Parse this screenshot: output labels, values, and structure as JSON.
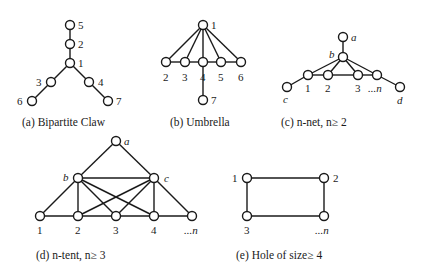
{
  "figures": [
    {
      "id": "a",
      "caption": "(a) Bipartite Claw",
      "caption_pos": [
        22,
        126
      ],
      "nodes": [
        {
          "label": "5",
          "x": 70,
          "y": 25,
          "lx": 78,
          "ly": 29,
          "italic": false
        },
        {
          "label": "2",
          "x": 70,
          "y": 44,
          "lx": 78,
          "ly": 48,
          "italic": false
        },
        {
          "label": "1",
          "x": 70,
          "y": 63,
          "lx": 78,
          "ly": 67,
          "italic": false
        },
        {
          "label": "3",
          "x": 51,
          "y": 82,
          "lx": 36,
          "ly": 86,
          "italic": false
        },
        {
          "label": "4",
          "x": 89,
          "y": 82,
          "lx": 98,
          "ly": 86,
          "italic": false
        },
        {
          "label": "6",
          "x": 32,
          "y": 101,
          "lx": 17,
          "ly": 105,
          "italic": false
        },
        {
          "label": "7",
          "x": 108,
          "y": 101,
          "lx": 116,
          "ly": 105,
          "italic": false
        }
      ],
      "edges": [
        [
          0,
          1
        ],
        [
          1,
          2
        ],
        [
          2,
          3
        ],
        [
          2,
          4
        ],
        [
          3,
          5
        ],
        [
          4,
          6
        ]
      ]
    },
    {
      "id": "b",
      "caption": "(b) Umbrella",
      "caption_pos": [
        170,
        126
      ],
      "nodes": [
        {
          "label": "1",
          "x": 203,
          "y": 25,
          "lx": 211,
          "ly": 29,
          "italic": false
        },
        {
          "label": "2",
          "x": 166,
          "y": 62,
          "lx": 163,
          "ly": 81,
          "italic": false
        },
        {
          "label": "3",
          "x": 185,
          "y": 62,
          "lx": 182,
          "ly": 81,
          "italic": false
        },
        {
          "label": "4",
          "x": 203,
          "y": 62,
          "lx": 200,
          "ly": 81,
          "italic": false
        },
        {
          "label": "5",
          "x": 221,
          "y": 62,
          "lx": 218,
          "ly": 81,
          "italic": false
        },
        {
          "label": "6",
          "x": 241,
          "y": 62,
          "lx": 238,
          "ly": 81,
          "italic": false
        },
        {
          "label": "7",
          "x": 203,
          "y": 100,
          "lx": 211,
          "ly": 104,
          "italic": false
        }
      ],
      "edges": [
        [
          0,
          1
        ],
        [
          0,
          2
        ],
        [
          0,
          3
        ],
        [
          0,
          4
        ],
        [
          0,
          5
        ],
        [
          1,
          2
        ],
        [
          2,
          3
        ],
        [
          3,
          4
        ],
        [
          4,
          5
        ],
        [
          3,
          6
        ]
      ]
    },
    {
      "id": "c",
      "caption": "(c) n-net, n≥ 2",
      "caption_pos": [
        281,
        126
      ],
      "nodes": [
        {
          "label": "a",
          "x": 343,
          "y": 37,
          "lx": 351,
          "ly": 41,
          "italic": true
        },
        {
          "label": "b",
          "x": 343,
          "y": 57,
          "lx": 329,
          "ly": 58,
          "italic": true
        },
        {
          "label": "1",
          "x": 308,
          "y": 75,
          "lx": 305,
          "ly": 92,
          "italic": false
        },
        {
          "label": "2",
          "x": 328,
          "y": 75,
          "lx": 325,
          "ly": 92,
          "italic": false
        },
        {
          "label": "3",
          "x": 358,
          "y": 75,
          "lx": 355,
          "ly": 92,
          "italic": false
        },
        {
          "label": "...n",
          "x": 377,
          "y": 75,
          "lx": 368,
          "ly": 92,
          "italic": true
        },
        {
          "label": "c",
          "x": 287,
          "y": 87,
          "lx": 283,
          "ly": 103,
          "italic": true
        },
        {
          "label": "d",
          "x": 400,
          "y": 87,
          "lx": 397,
          "ly": 104,
          "italic": true
        }
      ],
      "edges": [
        [
          0,
          1
        ],
        [
          1,
          2
        ],
        [
          1,
          3
        ],
        [
          1,
          4
        ],
        [
          1,
          5
        ],
        [
          2,
          3
        ],
        [
          3,
          4
        ],
        [
          4,
          5
        ],
        [
          6,
          2
        ],
        [
          5,
          7
        ]
      ]
    },
    {
      "id": "d",
      "caption": "(d) n-tent, n≥ 3",
      "caption_pos": [
        36,
        259
      ],
      "nodes": [
        {
          "label": "a",
          "x": 116,
          "y": 141,
          "lx": 124,
          "ly": 145,
          "italic": true
        },
        {
          "label": "b",
          "x": 78,
          "y": 178,
          "lx": 63,
          "ly": 181,
          "italic": true
        },
        {
          "label": "c",
          "x": 154,
          "y": 178,
          "lx": 164,
          "ly": 182,
          "italic": true
        },
        {
          "label": "1",
          "x": 40,
          "y": 216,
          "lx": 37,
          "ly": 234,
          "italic": false
        },
        {
          "label": "2",
          "x": 78,
          "y": 216,
          "lx": 75,
          "ly": 234,
          "italic": false
        },
        {
          "label": "3",
          "x": 116,
          "y": 216,
          "lx": 113,
          "ly": 234,
          "italic": false
        },
        {
          "label": "4",
          "x": 154,
          "y": 216,
          "lx": 151,
          "ly": 234,
          "italic": false
        },
        {
          "label": "...n",
          "x": 192,
          "y": 216,
          "lx": 184,
          "ly": 234,
          "italic": true
        }
      ],
      "edges": [
        [
          0,
          1
        ],
        [
          0,
          2
        ],
        [
          1,
          2
        ],
        [
          1,
          3
        ],
        [
          1,
          4
        ],
        [
          1,
          5
        ],
        [
          1,
          6
        ],
        [
          2,
          4
        ],
        [
          2,
          5
        ],
        [
          2,
          6
        ],
        [
          2,
          7
        ],
        [
          3,
          4
        ],
        [
          4,
          5
        ],
        [
          5,
          6
        ],
        [
          6,
          7
        ]
      ]
    },
    {
      "id": "e",
      "caption": "(e) Hole of size≥ 4",
      "caption_pos": [
        236,
        259
      ],
      "nodes": [
        {
          "label": "1",
          "x": 247,
          "y": 178,
          "lx": 232,
          "ly": 182,
          "italic": false
        },
        {
          "label": "2",
          "x": 324,
          "y": 178,
          "lx": 333,
          "ly": 182,
          "italic": false
        },
        {
          "label": "3",
          "x": 247,
          "y": 216,
          "lx": 244,
          "ly": 234,
          "italic": false
        },
        {
          "label": "...n",
          "x": 324,
          "y": 216,
          "lx": 315,
          "ly": 234,
          "italic": true
        }
      ],
      "edges": [
        [
          0,
          1
        ],
        [
          0,
          2
        ],
        [
          1,
          3
        ],
        [
          2,
          3
        ]
      ]
    }
  ],
  "style": {
    "node_radius": 4.5,
    "stroke_color": "#1a1a1a",
    "node_fill": "#ffffff"
  }
}
